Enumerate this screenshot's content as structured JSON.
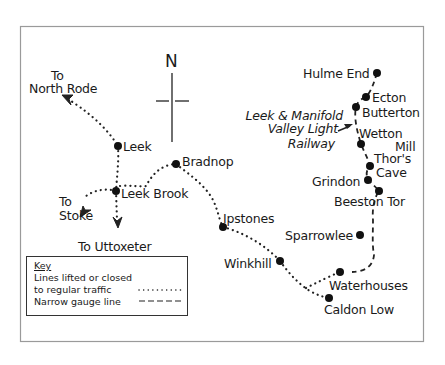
{
  "map": {
    "frame_color": "#9a9a9a",
    "ink_color": "#1a1a1a",
    "compass": {
      "label": "N"
    },
    "stations": [
      {
        "id": "hulme-end",
        "name": "Hulme End",
        "x": 377,
        "y": 73
      },
      {
        "id": "ecton",
        "name": "Ecton",
        "x": 366,
        "y": 97
      },
      {
        "id": "butterton",
        "name": "Butterton",
        "x": 356,
        "y": 107
      },
      {
        "id": "wetton-mill",
        "name": "Wetton Mill",
        "line1": "Wetton",
        "line2": "Mill",
        "x": 361,
        "y": 144
      },
      {
        "id": "thors-cave",
        "name": "Thor's Cave",
        "line1": "Thor's",
        "line2": "Cave",
        "x": 370,
        "y": 166
      },
      {
        "id": "grindon",
        "name": "Grindon",
        "x": 368,
        "y": 180
      },
      {
        "id": "beeston-tor",
        "name": "Beeston Tor",
        "x": 379,
        "y": 191
      },
      {
        "id": "sparrowlee",
        "name": "Sparrowlee",
        "x": 360,
        "y": 235
      },
      {
        "id": "waterhouses",
        "name": "Waterhouses",
        "x": 340,
        "y": 272
      },
      {
        "id": "caldon-low",
        "name": "Caldon Low",
        "x": 329,
        "y": 298
      },
      {
        "id": "winkhill",
        "name": "Winkhill",
        "x": 280,
        "y": 261
      },
      {
        "id": "ipstones",
        "name": "Ipstones",
        "x": 223,
        "y": 227
      },
      {
        "id": "bradnop",
        "name": "Bradnop",
        "x": 176,
        "y": 164
      },
      {
        "id": "leek",
        "name": "Leek",
        "x": 118,
        "y": 146
      },
      {
        "id": "leek-brook",
        "name": "Leek Brook",
        "x": 116,
        "y": 191
      }
    ],
    "destinations": {
      "north_rode": {
        "line1": "To",
        "line2": "North Rode"
      },
      "stoke": {
        "line1": "To",
        "line2": "Stoke"
      },
      "uttoxeter": {
        "label": "To Uttoxeter"
      }
    },
    "railway_label": {
      "line1": "Leek & Manifold",
      "line2": "Valley Light",
      "line3": "Railway"
    }
  },
  "legend": {
    "title": "Key",
    "items": [
      {
        "label_line1": "Lines lifted or closed",
        "label_line2": "to regular traffic",
        "style": "dotted"
      },
      {
        "label": "Narrow gauge line",
        "style": "dashed"
      }
    ]
  }
}
